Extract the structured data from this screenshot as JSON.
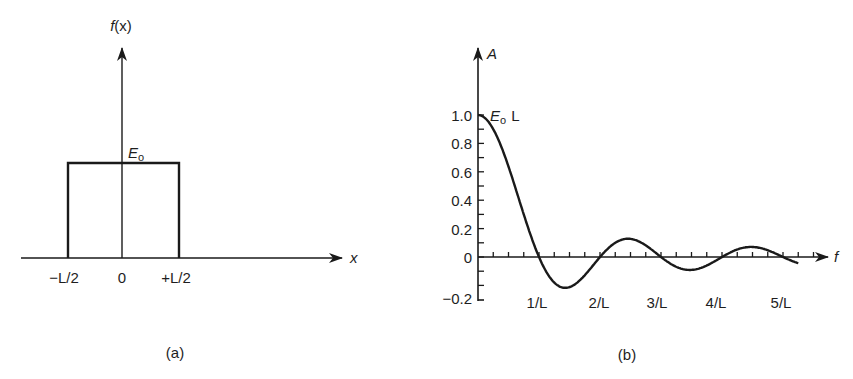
{
  "panel_a": {
    "caption": "(a)",
    "y_axis_label_f": "f",
    "y_axis_label_x": "(x)",
    "x_axis_label": "x",
    "amplitude_label": "E",
    "amplitude_subscript": "o",
    "tick_labels": [
      "−L/2",
      "0",
      "+L/2"
    ]
  },
  "panel_b": {
    "caption": "(b)",
    "y_axis_label": "A",
    "x_axis_label": "f",
    "peak_label_main": "E",
    "peak_label_sub": "o",
    "peak_label_suffix": "L",
    "y_tick_labels": [
      "1.0",
      "0.8",
      "0.6",
      "0.4",
      "0.2",
      "0",
      "−0.2"
    ],
    "x_tick_labels": [
      "1/L",
      "2/L",
      "3/L",
      "4/L",
      "5/L"
    ]
  },
  "chart_data": [
    {
      "type": "line",
      "title": "(a) Rectangular pulse f(x)",
      "xlabel": "x",
      "ylabel": "f(x)",
      "x": [
        "-L/2",
        "-L/2",
        "+L/2",
        "+L/2"
      ],
      "values": [
        0,
        1,
        1,
        0
      ],
      "annotations": [
        "E₀ (pulse height)"
      ],
      "tick_labels": [
        "−L/2",
        "0",
        "+L/2"
      ]
    },
    {
      "type": "line",
      "title": "(b) Amplitude spectrum A(f) = E₀L·sinc(fL)",
      "xlabel": "f",
      "ylabel": "A",
      "ylim": [
        -0.2,
        1.0
      ],
      "xlim_in_units_of_1_over_L": [
        0,
        5.25
      ],
      "y_ticks": [
        -0.2,
        0,
        0.2,
        0.4,
        0.6,
        0.8,
        1.0
      ],
      "x_ticks": [
        "1/L",
        "2/L",
        "3/L",
        "4/L",
        "5/L"
      ],
      "annotations": [
        "E₀ L at peak (f=0, A=1.0)"
      ],
      "x": [
        0,
        0.25,
        0.5,
        0.75,
        1.0,
        1.25,
        1.43,
        1.75,
        2.0,
        2.25,
        2.46,
        2.75,
        3.0,
        3.25,
        3.47,
        3.75,
        4.0,
        4.25,
        4.48,
        4.75,
        5.0,
        5.25
      ],
      "values": [
        1.0,
        0.9,
        0.64,
        0.3,
        0.0,
        -0.18,
        -0.217,
        -0.13,
        0.0,
        0.1,
        0.128,
        0.08,
        0.0,
        -0.07,
        -0.091,
        -0.06,
        0.0,
        0.05,
        0.071,
        0.05,
        0.0,
        -0.04
      ]
    }
  ]
}
